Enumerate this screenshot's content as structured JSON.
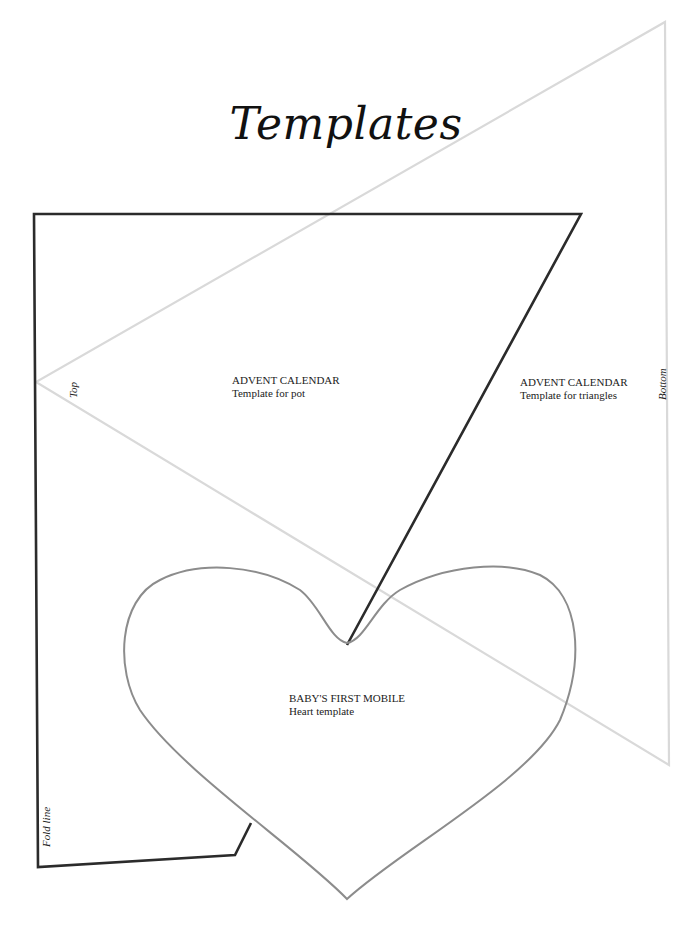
{
  "page": {
    "title": "Templates"
  },
  "templates": {
    "pot": {
      "heading": "ADVENT CALENDAR",
      "subtitle": "Template for pot",
      "side_label": "Fold line",
      "stroke_color": "#2b2b2b"
    },
    "triangles": {
      "heading": "ADVENT CALENDAR",
      "subtitle": "Template for triangles",
      "top_label": "Top",
      "bottom_label": "Bottom",
      "stroke_color": "#d8d8d8"
    },
    "heart": {
      "heading": "BABY'S FIRST MOBILE",
      "subtitle": "Heart template",
      "stroke_color": "#8c8c8c"
    }
  }
}
